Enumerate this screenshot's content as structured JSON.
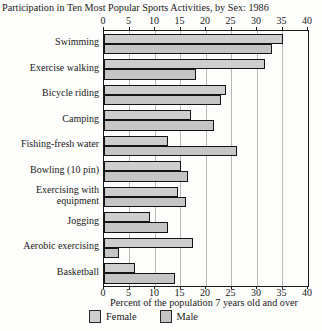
{
  "chart_data": {
    "type": "bar",
    "orientation": "horizontal",
    "title": "Participation in Ten Most Popular Sports Activities, by Sex: 1986",
    "xlabel": "Percent of the population 7 years old and over",
    "xlim": [
      0,
      40
    ],
    "xticks": [
      0,
      5,
      10,
      15,
      20,
      25,
      30,
      35,
      40
    ],
    "grid": true,
    "legend_position": "bottom",
    "categories": [
      "Swimming",
      "Exercise walking",
      "Bicycle riding",
      "Camping",
      "Fishing-fresh water",
      "Bowling (10 pin)",
      "Exercising with equipment",
      "Jogging",
      "Aerobic exercising",
      "Basketball"
    ],
    "series": [
      {
        "name": "Female",
        "color": "#cecece",
        "values": [
          35,
          31.5,
          24,
          17,
          12.5,
          15,
          14.5,
          9,
          17.5,
          6
        ]
      },
      {
        "name": "Male",
        "color": "#c5c5c5",
        "values": [
          33,
          18,
          23,
          21.5,
          26,
          16.5,
          16,
          12.5,
          3,
          14
        ]
      }
    ]
  }
}
